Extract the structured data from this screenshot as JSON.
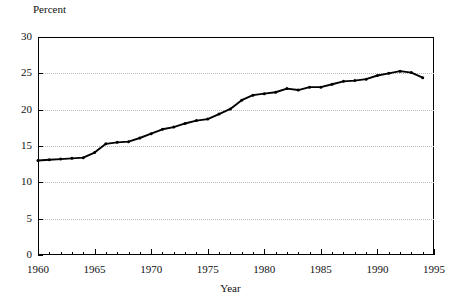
{
  "chart_data": {
    "type": "line",
    "title": "",
    "xlabel": "Year",
    "ylabel": "Percent",
    "xlim": [
      1960,
      1995
    ],
    "ylim": [
      0,
      30
    ],
    "grid": true,
    "legend": false,
    "y_ticks": [
      0,
      5,
      10,
      15,
      20,
      25,
      30
    ],
    "x_ticks": [
      1960,
      1965,
      1970,
      1975,
      1980,
      1985,
      1990,
      1995
    ],
    "x_minor_tick_step": 1,
    "series": [
      {
        "name": "Percent",
        "marker": "dot",
        "color": "#000000",
        "x": [
          1960,
          1961,
          1962,
          1963,
          1964,
          1965,
          1966,
          1967,
          1968,
          1969,
          1970,
          1971,
          1972,
          1973,
          1974,
          1975,
          1976,
          1977,
          1978,
          1979,
          1980,
          1981,
          1982,
          1983,
          1984,
          1985,
          1986,
          1987,
          1988,
          1989,
          1990,
          1991,
          1992,
          1993,
          1994
        ],
        "values": [
          13.0,
          13.1,
          13.2,
          13.3,
          13.4,
          14.1,
          15.3,
          15.5,
          15.6,
          16.1,
          16.7,
          17.3,
          17.6,
          18.1,
          18.5,
          18.7,
          19.4,
          20.1,
          21.3,
          22.0,
          22.2,
          22.4,
          22.9,
          22.7,
          23.1,
          23.1,
          23.5,
          23.9,
          24.0,
          24.2,
          24.7,
          25.0,
          25.3,
          25.1,
          24.4
        ]
      }
    ]
  }
}
